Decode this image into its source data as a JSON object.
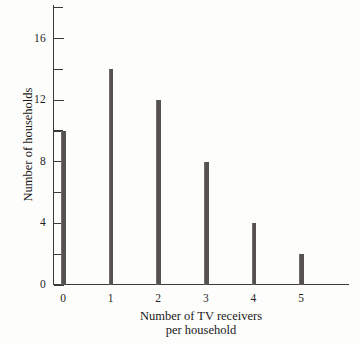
{
  "chart_data": {
    "type": "bar",
    "title": "",
    "subtitle": "",
    "xlabel_line1": "Number of TV receivers",
    "xlabel_line2": "per household",
    "ylabel": "Number of households",
    "categories": [
      "0",
      "1",
      "2",
      "3",
      "4",
      "5"
    ],
    "values": [
      10,
      14,
      12,
      8,
      4,
      2
    ],
    "series": [
      {
        "name": "Number of households",
        "values": [
          10,
          14,
          12,
          8,
          4,
          2
        ]
      }
    ],
    "xlim": [
      -0.35,
      5.95
    ],
    "ylim": [
      0,
      18.2
    ],
    "y_major_ticks": [
      0,
      4,
      8,
      12,
      16
    ],
    "y_major_tick_labels": [
      "0",
      "4",
      "8",
      "12",
      "16"
    ],
    "y_minor_ticks": [
      2,
      6,
      10,
      14,
      18
    ],
    "x_ticks": [
      0,
      1,
      2,
      3,
      4,
      5
    ],
    "grid": false,
    "legend": false,
    "legend_position": "none",
    "bar_style": "spike",
    "colors": {
      "bar": "#555251",
      "axis": "#3a3a3a",
      "text": "#1a1a1a",
      "background": "#fdfdfc"
    }
  }
}
